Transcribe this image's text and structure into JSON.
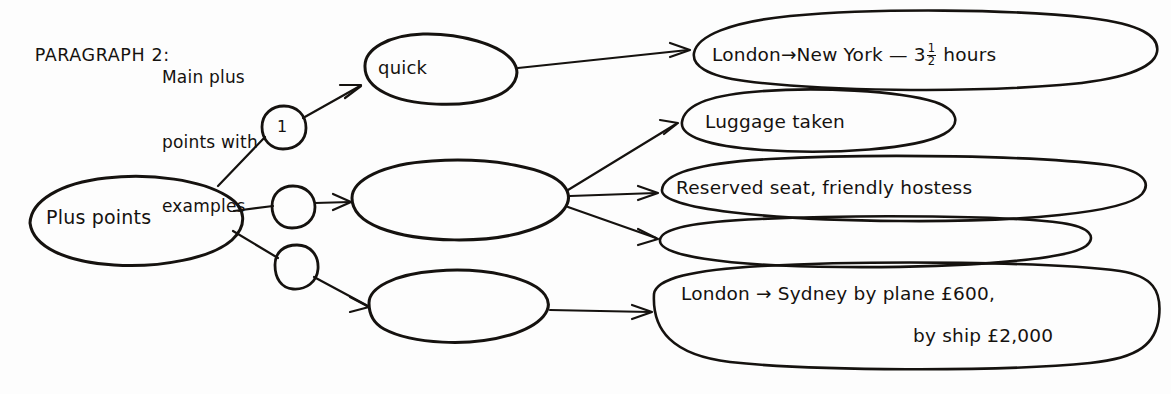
{
  "page": {
    "title": "PARAGRAPH 2: Main plus points with examples",
    "background_color": "#fdfdfd",
    "ink_color": "#15120f"
  },
  "heading": {
    "prefix": "PARAGRAPH 2:",
    "line1": "Main plus",
    "line2": "points with",
    "line3": "examples"
  },
  "nodes": {
    "root": {
      "label": "Plus points"
    },
    "branch1": {
      "label": "quick"
    },
    "branch2": {
      "label": ""
    },
    "branch3": {
      "label": ""
    }
  },
  "connectors": {
    "marker1": {
      "label": "1"
    },
    "marker2": {
      "label": ""
    },
    "marker3": {
      "label": ""
    }
  },
  "examples": {
    "e1": {
      "from": "London",
      "arrow": "→",
      "to": "New York",
      "dash": "—",
      "hours_whole": "3",
      "hours_num": "1",
      "hours_den": "2",
      "unit": "hours",
      "full_text": "London → New York — 3½ hours"
    },
    "e2": {
      "full_text": "Luggage taken"
    },
    "e3": {
      "full_text": "Reserved seat, friendly hostess"
    },
    "e4": {
      "full_text": ""
    },
    "e5": {
      "line1_pre": "London",
      "line1_arrow": "→",
      "line1_post": "Sydney by plane £600,",
      "line2": "by ship £2,000",
      "full_text": "London → Sydney by plane £600, by ship £2,000"
    }
  }
}
